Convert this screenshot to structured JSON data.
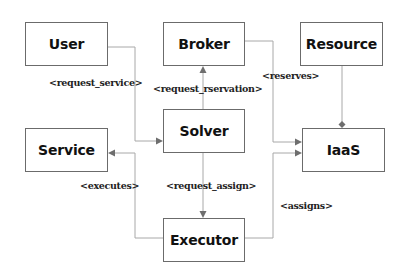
{
  "diagram": {
    "nodes": {
      "user": "User",
      "broker": "Broker",
      "resource": "Resource",
      "service": "Service",
      "solver": "Solver",
      "iaas": "IaaS",
      "executor": "Executor"
    },
    "edges": {
      "request_service": "<request_service>",
      "request_reservation": "<request_rservation>",
      "reserves": "<reserves>",
      "executes": "<executes>",
      "request_assign": "<request_assign>",
      "assigns": "<assigns>"
    },
    "relations": [
      {
        "from": "User",
        "to": "Solver",
        "label": "<request_service>",
        "type": "arrow"
      },
      {
        "from": "Solver",
        "to": "Broker",
        "label": "<request_rservation>",
        "type": "arrow"
      },
      {
        "from": "Broker",
        "to": "IaaS",
        "label": "<reserves>",
        "type": "arrow"
      },
      {
        "from": "Solver",
        "to": "Executor",
        "label": "<request_assign>",
        "type": "arrow"
      },
      {
        "from": "Executor",
        "to": "Service",
        "label": "<executes>",
        "type": "arrow"
      },
      {
        "from": "Executor",
        "to": "IaaS",
        "label": "<assigns>",
        "type": "arrow"
      },
      {
        "from": "Resource",
        "to": "IaaS",
        "label": "",
        "type": "composition"
      }
    ],
    "colors": {
      "box_border": "#6b6b6b",
      "connector": "#a8a8a8",
      "arrowhead": "#6e6e6e",
      "text": "#111111"
    }
  }
}
